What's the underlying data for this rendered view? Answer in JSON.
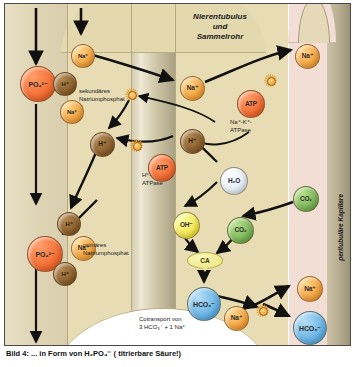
{
  "figure": {
    "title_lines": "Nierentubulus\nund\nSammelrohr",
    "vertical_label": "peritubuläre Kapillare",
    "caption": "Bild 4: ... in Form von H₂PO₄⁻ ( titrierbare Säure!)"
  },
  "labels": {
    "secondary_phosphate": "sekundäres\nNatriumphosphat",
    "primary_phosphate": "primäres\nNatriumphosphat",
    "h_atpase": "H⁺-\nATPase",
    "na_k_atpase": "Na⁺-K⁺-\nATPase",
    "cotransport": "Cotransport von\n3 HCO₃⁻ + 1 Na⁺"
  },
  "molecules": {
    "na": "Na⁺",
    "h": "H⁺",
    "po4": "PO₄²⁻",
    "po4_primary": "PO₄²⁻",
    "atp": "ATP",
    "h2o": "H₂O",
    "oh": "OH⁻",
    "co2": "CO₂",
    "hco3": "HCO₃⁻",
    "ca_enzyme": "CA"
  },
  "colors": {
    "sodium": "#f4a23c",
    "proton": "#8b5f2c",
    "phosphate": "#f26a30",
    "atp": "#f26a30",
    "water": "#e3ecf3",
    "hydroxide": "#f2e64a",
    "carbon_dioxide": "#78b455",
    "bicarbonate": "#63b2e4",
    "carbonic_anhydrase": "#f0ea8e",
    "tubule_cell": "#e7dcb3",
    "capillary": "#f3ded6",
    "transporter": "#f2a63f"
  },
  "nodes": [
    {
      "id": "na-lumen-top",
      "label": "Na⁺",
      "kind": "na",
      "x": 66,
      "y": 40,
      "d": 22
    },
    {
      "id": "po4-secondary",
      "label": "PO₄²⁻",
      "kind": "po4",
      "x": 15,
      "y": 62,
      "d": 34
    },
    {
      "id": "h-secondary",
      "label": "H⁺",
      "kind": "h",
      "x": 48,
      "y": 68,
      "d": 22
    },
    {
      "id": "na-lumen-mid",
      "label": "Na⁺",
      "kind": "na",
      "x": 55,
      "y": 96,
      "d": 22
    },
    {
      "id": "na-cell",
      "label": "Na⁺",
      "kind": "na",
      "x": 175,
      "y": 72,
      "d": 23
    },
    {
      "id": "na-capillary-top",
      "label": "Na⁺",
      "kind": "na",
      "x": 290,
      "y": 40,
      "d": 23
    },
    {
      "id": "atp-nak",
      "label": "ATP",
      "kind": "atp",
      "x": 232,
      "y": 86,
      "d": 26
    },
    {
      "id": "h-cell-left",
      "label": "H⁺",
      "kind": "h",
      "x": 85,
      "y": 128,
      "d": 23
    },
    {
      "id": "h-cell-right",
      "label": "H⁺",
      "kind": "h",
      "x": 175,
      "y": 125,
      "d": 23
    },
    {
      "id": "atp-hpump",
      "label": "ATP",
      "kind": "atp",
      "x": 143,
      "y": 150,
      "d": 26
    },
    {
      "id": "h2o",
      "label": "H₂O",
      "kind": "h2o",
      "x": 215,
      "y": 163,
      "d": 26
    },
    {
      "id": "co2-capillary",
      "label": "CO₂",
      "kind": "co2",
      "x": 288,
      "y": 182,
      "d": 24
    },
    {
      "id": "h-apical-lower",
      "label": "H⁺",
      "kind": "h",
      "x": 52,
      "y": 208,
      "d": 22
    },
    {
      "id": "oh",
      "label": "OH⁻",
      "kind": "oh",
      "x": 168,
      "y": 208,
      "d": 25
    },
    {
      "id": "co2-cell",
      "label": "CO₂",
      "kind": "co2",
      "x": 222,
      "y": 213,
      "d": 25
    },
    {
      "id": "po4-primary",
      "label": "PO₄²⁻",
      "kind": "po4",
      "x": 22,
      "y": 232,
      "d": 34
    },
    {
      "id": "na-primary",
      "label": "Na⁺",
      "kind": "na",
      "x": 66,
      "y": 232,
      "d": 23
    },
    {
      "id": "h-primary",
      "label": "H⁺",
      "kind": "h",
      "x": 48,
      "y": 258,
      "d": 22
    },
    {
      "id": "hco3-cell",
      "label": "HCO₃⁻",
      "kind": "hco3",
      "x": 182,
      "y": 283,
      "d": 32
    },
    {
      "id": "na-cotransport",
      "label": "Na⁺",
      "kind": "na",
      "x": 219,
      "y": 302,
      "d": 23
    },
    {
      "id": "na-capillary-bot",
      "label": "Na⁺",
      "kind": "na",
      "x": 292,
      "y": 272,
      "d": 24
    },
    {
      "id": "hco3-capillary",
      "label": "HCO₃⁻",
      "kind": "hco3",
      "x": 288,
      "y": 307,
      "d": 32
    }
  ],
  "transporters": [
    {
      "id": "transporter-apical-upper",
      "x": 120,
      "y": 84
    },
    {
      "id": "transporter-h-atpase",
      "x": 125,
      "y": 135
    },
    {
      "id": "transporter-na-k-atpase",
      "x": 259,
      "y": 70
    },
    {
      "id": "transporter-basolateral",
      "x": 251,
      "y": 300
    }
  ]
}
